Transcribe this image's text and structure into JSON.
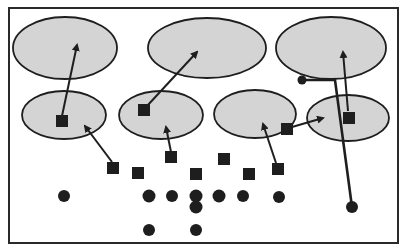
{
  "diagram": {
    "type": "play-diagram",
    "colors": {
      "zone_fill": "#d4d4d4",
      "stroke": "#1e1e1e",
      "marker": "#1e1e1e",
      "background": "#ffffff",
      "frame": "#2a2a2a"
    },
    "frame": {
      "x": 9,
      "y": 8,
      "w": 389,
      "h": 235
    },
    "zones": [
      {
        "name": "deep-zone-left",
        "cx": 65,
        "cy": 48,
        "rx": 52,
        "ry": 31
      },
      {
        "name": "deep-zone-middle",
        "cx": 207,
        "cy": 48,
        "rx": 59,
        "ry": 30
      },
      {
        "name": "deep-zone-right",
        "cx": 331,
        "cy": 48,
        "rx": 55,
        "ry": 31
      },
      {
        "name": "short-zone-1",
        "cx": 64,
        "cy": 115,
        "rx": 42,
        "ry": 24
      },
      {
        "name": "short-zone-2",
        "cx": 161,
        "cy": 115,
        "rx": 42,
        "ry": 24
      },
      {
        "name": "short-zone-3",
        "cx": 255,
        "cy": 114,
        "rx": 41,
        "ry": 24
      },
      {
        "name": "short-zone-4",
        "cx": 348,
        "cy": 118,
        "rx": 41,
        "ry": 23
      }
    ],
    "defenders": [
      {
        "name": "defender-1",
        "x": 62,
        "y": 121,
        "size": 12
      },
      {
        "name": "defender-2",
        "x": 144,
        "y": 110,
        "size": 12
      },
      {
        "name": "defender-3",
        "x": 113,
        "y": 168,
        "size": 12
      },
      {
        "name": "defender-4",
        "x": 138,
        "y": 173,
        "size": 12
      },
      {
        "name": "defender-5",
        "x": 171,
        "y": 157,
        "size": 12
      },
      {
        "name": "defender-6",
        "x": 196,
        "y": 174,
        "size": 12
      },
      {
        "name": "defender-7",
        "x": 224,
        "y": 159,
        "size": 12
      },
      {
        "name": "defender-8",
        "x": 249,
        "y": 174,
        "size": 12
      },
      {
        "name": "defender-9",
        "x": 278,
        "y": 169,
        "size": 12
      },
      {
        "name": "defender-10",
        "x": 287,
        "y": 129,
        "size": 12
      },
      {
        "name": "defender-11",
        "x": 349,
        "y": 118,
        "size": 12
      }
    ],
    "offense": [
      {
        "name": "offense-1",
        "x": 64,
        "y": 196,
        "r": 6
      },
      {
        "name": "offense-2",
        "x": 149,
        "y": 196,
        "r": 6.5
      },
      {
        "name": "offense-3",
        "x": 172,
        "y": 196,
        "r": 6
      },
      {
        "name": "offense-4",
        "x": 196,
        "y": 196,
        "r": 6.5
      },
      {
        "name": "offense-5",
        "x": 196,
        "y": 207,
        "r": 6.5
      },
      {
        "name": "offense-6",
        "x": 219,
        "y": 196,
        "r": 6.5
      },
      {
        "name": "offense-7",
        "x": 243,
        "y": 196,
        "r": 6
      },
      {
        "name": "offense-8",
        "x": 279,
        "y": 197,
        "r": 6
      },
      {
        "name": "offense-9",
        "x": 149,
        "y": 230,
        "r": 6
      },
      {
        "name": "offense-10",
        "x": 196,
        "y": 230,
        "r": 6
      },
      {
        "name": "offense-11",
        "x": 352,
        "y": 207,
        "r": 6
      },
      {
        "name": "offense-12",
        "x": 302,
        "y": 80,
        "r": 4.5
      }
    ],
    "arrows": [
      {
        "name": "drop-arrow-1",
        "x1": 62,
        "y1": 116,
        "x2": 77,
        "y2": 45
      },
      {
        "name": "drop-arrow-2",
        "x1": 147,
        "y1": 106,
        "x2": 197,
        "y2": 52
      },
      {
        "name": "drop-arrow-3",
        "x1": 112,
        "y1": 162,
        "x2": 85,
        "y2": 126
      },
      {
        "name": "drop-arrow-4",
        "x1": 171,
        "y1": 152,
        "x2": 166,
        "y2": 127
      },
      {
        "name": "drop-arrow-5",
        "x1": 276,
        "y1": 163,
        "x2": 263,
        "y2": 124
      },
      {
        "name": "drop-arrow-6",
        "x1": 292,
        "y1": 127,
        "x2": 323,
        "y2": 118
      },
      {
        "name": "drop-arrow-7",
        "x1": 348,
        "y1": 111,
        "x2": 343,
        "y2": 52
      }
    ],
    "routes": [
      {
        "name": "receiver-route",
        "points": "302,80 335,80 352,207",
        "width": 2.6
      }
    ]
  }
}
